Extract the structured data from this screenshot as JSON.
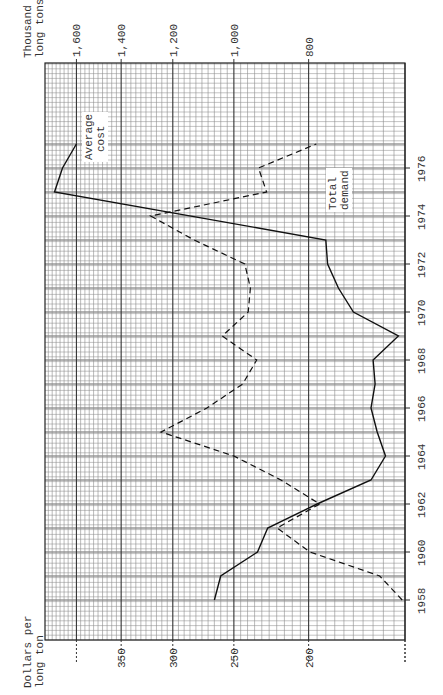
{
  "chart_data": {
    "type": "line",
    "orientation": "rotated-90-ccw",
    "title": "",
    "x": [
      1958,
      1959,
      1960,
      1961,
      1962,
      1963,
      1964,
      1965,
      1966,
      1967,
      1968,
      1969,
      1970,
      1971,
      1972,
      1973,
      1974,
      1975,
      1976,
      1977
    ],
    "xlabel": "Year",
    "xlim": [
      1958,
      1977
    ],
    "x_ticks": [
      "1958",
      "1960",
      "1962",
      "1964",
      "1966",
      "1968",
      "1970",
      "1972",
      "1974",
      "1976"
    ],
    "left_axis": {
      "label": "Dollars per long ton",
      "scale": "log",
      "ticks": [
        "200",
        "250",
        "300",
        "350"
      ],
      "range": [
        150,
        440
      ]
    },
    "right_axis": {
      "label": "Thousand long tons",
      "scale": "log",
      "ticks": [
        "800",
        "1,000",
        "1,200",
        "1,400",
        "1,600"
      ],
      "range": [
        600,
        1760
      ]
    },
    "series": [
      {
        "name": "Average cost",
        "axis": "left",
        "style": "solid",
        "x": [
          1958,
          1959,
          1960,
          1961,
          1962,
          1963,
          1964,
          1965,
          1966,
          1967,
          1968,
          1969,
          1970,
          1971,
          1972,
          1973,
          1975,
          1976,
          1977
        ],
        "values": [
          265,
          260,
          233,
          226,
          195,
          166,
          159,
          163,
          166,
          164,
          165,
          153,
          175,
          183,
          189,
          190,
          427,
          417,
          400
        ]
      },
      {
        "name": "Total demand",
        "axis": "right",
        "style": "dashed",
        "x": [
          1958,
          1959,
          1960,
          1961,
          1962,
          1963,
          1964,
          1965,
          1966,
          1967,
          1968,
          1969,
          1970,
          1971,
          1972,
          1973,
          1974,
          1975,
          1976,
          1977
        ],
        "values": [
          605,
          647,
          797,
          879,
          774,
          869,
          1000,
          1243,
          1084,
          974,
          934,
          1035,
          958,
          952,
          968,
          1126,
          1282,
          907,
          929,
          782
        ]
      }
    ],
    "annotations": [
      "Average cost",
      "Total demand"
    ],
    "grid": true,
    "legend": "none (inline labels)"
  },
  "labels": {
    "left_axis_title_1": "Dollars per",
    "left_axis_title_2": "long ton",
    "right_axis_title_1": "Thousand",
    "right_axis_title_2": "long tons",
    "avg_cost_1": "Average",
    "avg_cost_2": "cost",
    "demand_1": "Total",
    "demand_2": "demand"
  }
}
